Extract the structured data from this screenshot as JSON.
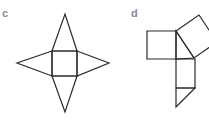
{
  "figures": [
    {
      "label": "c",
      "description": "Square with four isosceles triangles attached to each side (net of a square pyramid)",
      "square": [
        [
          52,
          51
        ],
        [
          77,
          51
        ],
        [
          77,
          76
        ],
        [
          52,
          76
        ]
      ],
      "triangles": [
        [
          [
            52,
            51
          ],
          [
            65,
            14
          ],
          [
            77,
            51
          ]
        ],
        [
          [
            77,
            51
          ],
          [
            109,
            63
          ],
          [
            77,
            76
          ]
        ],
        [
          [
            52,
            76
          ],
          [
            65,
            112
          ],
          [
            77,
            76
          ]
        ],
        [
          [
            52,
            51
          ],
          [
            17,
            63
          ],
          [
            52,
            76
          ]
        ]
      ]
    },
    {
      "label": "d",
      "description": "Right triangle with squares on its sides plus an attached rectangle and triangle",
      "left_square": [
        [
          147,
          31
        ],
        [
          176,
          31
        ],
        [
          176,
          59
        ],
        [
          147,
          59
        ]
      ],
      "tilted_square": [
        [
          176,
          31
        ],
        [
          199,
          15
        ],
        [
          217,
          42
        ],
        [
          194,
          58
        ]
      ],
      "central_triangle": [
        [
          176,
          31
        ],
        [
          194,
          58
        ],
        [
          176,
          59
        ]
      ],
      "lower_rectangle": [
        [
          176,
          59
        ],
        [
          195,
          59
        ],
        [
          195,
          88
        ],
        [
          176,
          88
        ]
      ],
      "bottom_triangle": [
        [
          176,
          88
        ],
        [
          195,
          88
        ],
        [
          176,
          107
        ]
      ]
    }
  ],
  "colors": {
    "line": "#2a2a2a",
    "label": "#8a8a8a",
    "background": "#ffffff"
  }
}
